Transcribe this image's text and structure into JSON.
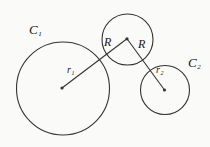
{
  "diagram": {
    "background_color": "#fafaf8",
    "stroke_color": "#333333",
    "label_color": "#161616",
    "stroke_width": 1.1,
    "canvas": {
      "width": 210,
      "height": 147
    },
    "circles": [
      {
        "id": "circle-c1",
        "cx": 63,
        "cy": 88.5,
        "r": 46.5
      },
      {
        "id": "circle-middle",
        "cx": 127.5,
        "cy": 39.5,
        "r": 25.5
      },
      {
        "id": "circle-c2",
        "cx": 165,
        "cy": 90,
        "r": 24.5
      }
    ],
    "center_dots": [
      {
        "id": "center-dot-c1",
        "cx": 62,
        "cy": 88,
        "r": 1.6
      },
      {
        "id": "center-dot-middle",
        "cx": 127,
        "cy": 38.8,
        "r": 1.6
      },
      {
        "id": "center-dot-c2",
        "cx": 164.5,
        "cy": 90,
        "r": 1.6
      }
    ],
    "segments": [
      {
        "id": "segment-r1-R",
        "x1": 62,
        "y1": 88,
        "x2": 127,
        "y2": 38.8
      },
      {
        "id": "segment-R-r2",
        "x1": 127,
        "y1": 38.8,
        "x2": 164.5,
        "y2": 90
      }
    ],
    "labels": [
      {
        "id": "label-c1",
        "main": "C",
        "sub": "1",
        "x": 29,
        "y": 34,
        "font_size": 13
      },
      {
        "id": "label-r-left",
        "main": "R",
        "sub": "",
        "x": 104,
        "y": 46,
        "font_size": 12
      },
      {
        "id": "label-r-right",
        "main": "R",
        "sub": "",
        "x": 138,
        "y": 48,
        "font_size": 12
      },
      {
        "id": "label-r1",
        "main": "r",
        "sub": "1",
        "x": 67,
        "y": 73,
        "font_size": 10
      },
      {
        "id": "label-r2",
        "main": "r",
        "sub": "2",
        "x": 156,
        "y": 73,
        "font_size": 10
      },
      {
        "id": "label-c2",
        "main": "C",
        "sub": "2",
        "x": 188,
        "y": 67,
        "font_size": 13
      }
    ]
  }
}
